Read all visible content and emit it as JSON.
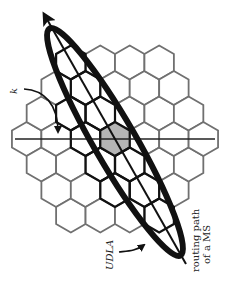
{
  "diagram": {
    "grid": {
      "cx": 115,
      "cy": 139,
      "hex_radius": 17,
      "cluster_radius": 3,
      "orientation": "pointy-top",
      "cell_stroke": "#707070",
      "highlight_stroke": "#111111",
      "center_fill": "#b5b5b5"
    },
    "axis_line": {
      "x1": 15,
      "y1": 139,
      "x2": 215,
      "y2": 139,
      "color": "#222222"
    },
    "ellipse": {
      "cx": 115,
      "cy": 142,
      "rx": 131,
      "ry": 21,
      "angle": 60,
      "stroke": "#111111",
      "stroke_width": 6
    },
    "routing_path": {
      "x1": 186,
      "y1": 264,
      "x2": 44,
      "y2": 14,
      "color": "#111111"
    },
    "labels": {
      "k": "k",
      "udla": "UDLA",
      "routing_line1": "routing path",
      "routing_line2": "of a MS"
    }
  }
}
